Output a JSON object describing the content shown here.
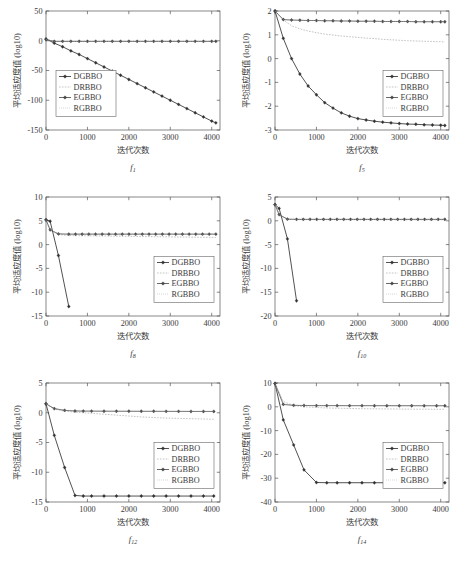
{
  "figure": {
    "panel_count": 6,
    "footnote": ""
  },
  "common": {
    "ylabel": "平均适应度值 (log10)",
    "xlabel": "迭代次数",
    "xticks": [
      0,
      1000,
      2000,
      3000,
      4000
    ],
    "xlim": [
      0,
      4200
    ],
    "series_names": [
      "DGBBO",
      "DRBBO",
      "EGBBO",
      "RGBBO"
    ],
    "colors": {
      "DGBBO": "#333333",
      "DRBBO": "#9a9a9a",
      "EGBBO": "#444444",
      "RGBBO": "#b0b0b0",
      "axis": "#555555",
      "background": "#ffffff"
    }
  },
  "chart_data": [
    {
      "type": "line",
      "title": "f1",
      "caption_base": "f",
      "caption_sub": "1",
      "xlabel": "迭代次数",
      "ylabel": "平均适应度值 (log10)",
      "xlim": [
        0,
        4200
      ],
      "ylim": [
        -150,
        50
      ],
      "xticks": [
        0,
        1000,
        2000,
        3000,
        4000
      ],
      "yticks": [
        50,
        0,
        -50,
        -100,
        -150
      ],
      "grid": false,
      "legend_position": "center-left",
      "x": [
        0,
        200,
        400,
        600,
        800,
        1000,
        1200,
        1400,
        1600,
        1800,
        2000,
        2200,
        2400,
        2600,
        2800,
        3000,
        3200,
        3400,
        3600,
        3800,
        4000,
        4100
      ],
      "series": [
        {
          "name": "DGBBO",
          "values": [
            3,
            -4,
            -10,
            -17,
            -23,
            -30,
            -37,
            -44,
            -51,
            -58,
            -65,
            -72,
            -79,
            -86,
            -93,
            -100,
            -107,
            -114,
            -121,
            -128,
            -135,
            -138
          ]
        },
        {
          "name": "DRBBO",
          "values": [
            2,
            -1,
            -1,
            -1,
            -1,
            -1,
            -1,
            -1,
            -1,
            -1,
            -1,
            -1,
            -1,
            -1,
            -1,
            -1,
            -1,
            -1,
            -1,
            -1,
            -1,
            -1
          ]
        },
        {
          "name": "EGBBO",
          "values": [
            2,
            -1,
            -1,
            -1,
            -1,
            -1,
            -1,
            -1,
            -1,
            -1,
            -1,
            -1,
            -1,
            -1,
            -1,
            -1,
            -1,
            -1,
            -1,
            -1,
            -1,
            -1
          ]
        },
        {
          "name": "RGBBO",
          "values": [
            2,
            -1,
            -1,
            -1,
            -1,
            -1,
            -1,
            -1,
            -1,
            -1,
            -1,
            -1,
            -1,
            -1,
            -1,
            -1,
            -1,
            -1,
            -1,
            -1,
            -1,
            -1
          ]
        }
      ]
    },
    {
      "type": "line",
      "title": "f5",
      "caption_base": "f",
      "caption_sub": "5",
      "xlabel": "迭代次数",
      "ylabel": "平均适应度值 (log10)",
      "xlim": [
        0,
        4200
      ],
      "ylim": [
        -3,
        2
      ],
      "xticks": [
        0,
        1000,
        2000,
        3000,
        4000
      ],
      "yticks": [
        2,
        1,
        0,
        -1,
        -2,
        -3
      ],
      "grid": false,
      "legend_position": "center-right",
      "x": [
        0,
        200,
        400,
        600,
        800,
        1000,
        1200,
        1400,
        1600,
        1800,
        2000,
        2200,
        2400,
        2600,
        2800,
        3000,
        3200,
        3400,
        3600,
        3800,
        4000,
        4100
      ],
      "series": [
        {
          "name": "DGBBO",
          "values": [
            2.0,
            0.85,
            0.0,
            -0.65,
            -1.15,
            -1.52,
            -1.85,
            -2.08,
            -2.28,
            -2.42,
            -2.52,
            -2.58,
            -2.63,
            -2.67,
            -2.7,
            -2.73,
            -2.75,
            -2.76,
            -2.78,
            -2.79,
            -2.8,
            -2.81
          ]
        },
        {
          "name": "DRBBO",
          "values": [
            2.0,
            1.62,
            1.38,
            1.25,
            1.16,
            1.09,
            1.03,
            0.99,
            0.95,
            0.92,
            0.89,
            0.86,
            0.84,
            0.81,
            0.79,
            0.77,
            0.75,
            0.74,
            0.73,
            0.72,
            0.71,
            0.7
          ]
        },
        {
          "name": "EGBBO",
          "values": [
            2.0,
            1.64,
            1.62,
            1.61,
            1.6,
            1.6,
            1.59,
            1.59,
            1.58,
            1.58,
            1.57,
            1.57,
            1.57,
            1.56,
            1.56,
            1.56,
            1.56,
            1.55,
            1.55,
            1.55,
            1.55,
            1.55
          ]
        },
        {
          "name": "RGBBO",
          "values": [
            2.0,
            1.64,
            1.62,
            1.61,
            1.6,
            1.6,
            1.59,
            1.59,
            1.58,
            1.58,
            1.57,
            1.57,
            1.57,
            1.56,
            1.56,
            1.56,
            1.56,
            1.55,
            1.55,
            1.55,
            1.55,
            1.55
          ]
        }
      ]
    },
    {
      "type": "line",
      "title": "f8",
      "caption_base": "f",
      "caption_sub": "8",
      "xlabel": "迭代次数",
      "ylabel": "平均适应度值 (log10)",
      "xlim": [
        0,
        4200
      ],
      "ylim": [
        -15,
        10
      ],
      "xticks": [
        0,
        1000,
        2000,
        3000,
        4000
      ],
      "yticks": [
        10,
        5,
        0,
        -5,
        -10,
        -15
      ],
      "grid": false,
      "legend_position": "center-right",
      "x": [
        0,
        100,
        300,
        550
      ],
      "series": [
        {
          "name": "DGBBO",
          "values": [
            5.2,
            4.9,
            -2.3,
            -13.0
          ]
        },
        {
          "name": "DRBBO",
          "values": [
            5.2,
            3.0,
            2.1,
            1.9
          ]
        },
        {
          "name": "EGBBO",
          "values": [
            5.2,
            3.1,
            2.25,
            2.2
          ]
        },
        {
          "name": "RGBBO",
          "values": [
            5.2,
            3.1,
            2.25,
            2.2
          ]
        }
      ],
      "flat_tails": [
        {
          "name": "DRBBO",
          "from_x": 550,
          "to_x": 4100,
          "y_start": 1.9,
          "y_end": 1.5
        },
        {
          "name": "EGBBO",
          "from_x": 550,
          "to_x": 4100,
          "y_start": 2.2,
          "y_end": 2.2
        },
        {
          "name": "RGBBO",
          "from_x": 550,
          "to_x": 4100,
          "y_start": 2.2,
          "y_end": 2.2
        }
      ]
    },
    {
      "type": "line",
      "title": "f10",
      "caption_base": "f",
      "caption_sub": "10",
      "xlabel": "迭代次数",
      "ylabel": "平均适应度值 (log10)",
      "xlim": [
        0,
        4200
      ],
      "ylim": [
        -20,
        5
      ],
      "xticks": [
        0,
        1000,
        2000,
        3000,
        4000
      ],
      "yticks": [
        5,
        0,
        -5,
        -10,
        -15,
        -20
      ],
      "grid": false,
      "legend_position": "center-right",
      "x": [
        0,
        100,
        300,
        520
      ],
      "series": [
        {
          "name": "DGBBO",
          "values": [
            3.4,
            2.6,
            -3.8,
            -16.8
          ]
        },
        {
          "name": "DRBBO",
          "values": [
            3.4,
            1.2,
            0.3,
            0.25
          ]
        },
        {
          "name": "EGBBO",
          "values": [
            3.4,
            1.3,
            0.35,
            0.3
          ]
        },
        {
          "name": "RGBBO",
          "values": [
            3.4,
            1.3,
            0.35,
            0.3
          ]
        }
      ],
      "flat_tails": [
        {
          "name": "DRBBO",
          "from_x": 520,
          "to_x": 4100,
          "y_start": 0.25,
          "y_end": 0.2
        },
        {
          "name": "EGBBO",
          "from_x": 520,
          "to_x": 4100,
          "y_start": 0.3,
          "y_end": 0.3
        },
        {
          "name": "RGBBO",
          "from_x": 520,
          "to_x": 4100,
          "y_start": 0.3,
          "y_end": 0.3
        }
      ]
    },
    {
      "type": "line",
      "title": "f12",
      "caption_base": "f",
      "caption_sub": "12",
      "xlabel": "迭代次数",
      "ylabel": "平均适应度值 (log10)",
      "xlim": [
        0,
        4200
      ],
      "ylim": [
        -15,
        5
      ],
      "xticks": [
        0,
        1000,
        2000,
        3000,
        4000
      ],
      "yticks": [
        5,
        0,
        -5,
        -10,
        -15
      ],
      "grid": false,
      "legend_position": "center-right",
      "x": [
        0,
        200,
        450,
        700,
        900,
        1100,
        1400,
        1700,
        2000,
        2300,
        2600,
        2900,
        3200,
        3500,
        3800,
        4050
      ],
      "series": [
        {
          "name": "DGBBO",
          "values": [
            1.5,
            -3.8,
            -9.2,
            -13.9,
            -14.0,
            -14.0,
            -14.0,
            -14.0,
            -14.0,
            -14.0,
            -14.0,
            -14.0,
            -14.0,
            -14.0,
            -14.0,
            -14.0
          ]
        },
        {
          "name": "DRBBO",
          "values": [
            1.5,
            0.6,
            0.25,
            0.1,
            0.0,
            -0.1,
            -0.25,
            -0.4,
            -0.55,
            -0.7,
            -0.8,
            -0.9,
            -0.95,
            -1.0,
            -1.05,
            -1.1
          ]
        },
        {
          "name": "EGBBO",
          "values": [
            1.5,
            0.7,
            0.4,
            0.3,
            0.28,
            0.27,
            0.26,
            0.25,
            0.25,
            0.24,
            0.24,
            0.23,
            0.23,
            0.22,
            0.22,
            0.22
          ]
        },
        {
          "name": "RGBBO",
          "values": [
            1.5,
            0.7,
            0.4,
            0.3,
            0.28,
            0.27,
            0.26,
            0.25,
            0.25,
            0.24,
            0.24,
            0.23,
            0.23,
            0.22,
            0.22,
            0.22
          ]
        }
      ]
    },
    {
      "type": "line",
      "title": "f14",
      "caption_base": "f",
      "caption_sub": "14",
      "xlabel": "迭代次数",
      "ylabel": "平均适应度值 (log10)",
      "xlim": [
        0,
        4200
      ],
      "ylim": [
        -40,
        10
      ],
      "xticks": [
        0,
        1000,
        2000,
        3000,
        4000
      ],
      "yticks": [
        10,
        0,
        -10,
        -20,
        -30,
        -40
      ],
      "grid": false,
      "legend_position": "center-right",
      "x": [
        0,
        200,
        450,
        700,
        1000,
        1250,
        1500,
        1800,
        2100,
        2400,
        2700,
        3000,
        3300,
        3600,
        3900,
        4100
      ],
      "series": [
        {
          "name": "DGBBO",
          "values": [
            9.8,
            -5.5,
            -16.0,
            -26.5,
            -31.8,
            -31.9,
            -31.9,
            -31.9,
            -31.9,
            -31.9,
            -31.9,
            -31.9,
            -31.9,
            -31.9,
            -31.9,
            -31.9
          ]
        },
        {
          "name": "DRBBO",
          "values": [
            9.8,
            2.2,
            0.5,
            0.0,
            -0.3,
            -0.5,
            -0.6,
            -0.7,
            -0.8,
            -0.85,
            -0.9,
            -0.95,
            -1.0,
            -1.0,
            -1.05,
            -1.05
          ]
        },
        {
          "name": "EGBBO",
          "values": [
            9.8,
            1.0,
            0.6,
            0.55,
            0.5,
            0.5,
            0.5,
            0.48,
            0.48,
            0.47,
            0.47,
            0.46,
            0.46,
            0.45,
            0.45,
            0.45
          ]
        },
        {
          "name": "RGBBO",
          "values": [
            9.8,
            1.0,
            0.6,
            0.55,
            0.5,
            0.5,
            0.5,
            0.48,
            0.48,
            0.47,
            0.47,
            0.46,
            0.46,
            0.45,
            0.45,
            0.45
          ]
        }
      ]
    }
  ]
}
